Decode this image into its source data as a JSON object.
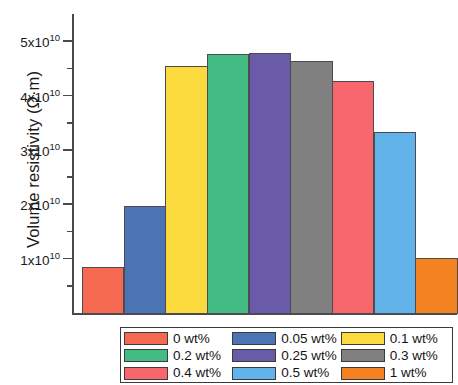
{
  "chart_data": {
    "type": "bar",
    "title": "",
    "xlabel": "",
    "ylabel": "Volume resistivity (Ω·m)",
    "ylim": [
      0,
      50000000000
    ],
    "grid": false,
    "legend_position": "bottom",
    "y_tick_labels": [
      "5x10",
      "4x10",
      "3x10",
      "2x10",
      "1x10"
    ],
    "y_tick_exponent": "10",
    "y_tick_values": [
      50000000000,
      40000000000,
      30000000000,
      20000000000,
      10000000000
    ],
    "y_minor_tick_values": [
      45000000000,
      35000000000,
      25000000000,
      15000000000,
      5000000000
    ],
    "categories": [
      "0 wt%",
      "0.05 wt%",
      "0.1 wt%",
      "0.2 wt%",
      "0.25 wt%",
      "0.3 wt%",
      "0.4 wt%",
      "0.5 wt%",
      "1 wt%"
    ],
    "values": [
      8600000000,
      19800000000,
      45700000000,
      47900000000,
      48100000000,
      46600000000,
      42800000000,
      33400000000,
      10300000000
    ],
    "colors": [
      "#f4694f",
      "#4a74b4",
      "#fada3c",
      "#44bb82",
      "#6a5ba8",
      "#808080",
      "#f9676e",
      "#62b3ea",
      "#f58220"
    ],
    "bar_edge_color": "#4b4b52",
    "axis_color": "#4a4a4a"
  },
  "legend": {
    "items": [
      {
        "label": "0 wt%",
        "color": "#f4694f"
      },
      {
        "label": "0.05 wt%",
        "color": "#4a74b4"
      },
      {
        "label": "0.1 wt%",
        "color": "#fada3c"
      },
      {
        "label": "0.2 wt%",
        "color": "#44bb82"
      },
      {
        "label": "0.25 wt%",
        "color": "#6a5ba8"
      },
      {
        "label": "0.3 wt%",
        "color": "#808080"
      },
      {
        "label": "0.4 wt%",
        "color": "#f9676e"
      },
      {
        "label": "0.5 wt%",
        "color": "#62b3ea"
      },
      {
        "label": "1 wt%",
        "color": "#f58220"
      }
    ]
  }
}
